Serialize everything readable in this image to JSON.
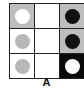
{
  "figure": {
    "label": "A",
    "rows": 3,
    "cols": 3,
    "colors": {
      "grey_bg": "#bdbdbd",
      "white_bg": "#ffffff",
      "black_bg": "#0a0a0a",
      "white_disc": "#ffffff",
      "grey_disc": "#b8b8b8",
      "black_disc": "#111111"
    },
    "cells": [
      {
        "row": 0,
        "col": 0,
        "bg": "#bdbdbd",
        "disc": "#ffffff"
      },
      {
        "row": 0,
        "col": 1,
        "bg": "#ffffff",
        "disc": null
      },
      {
        "row": 0,
        "col": 2,
        "bg": "#bdbdbd",
        "disc": "#111111"
      },
      {
        "row": 1,
        "col": 0,
        "bg": "#ffffff",
        "disc": "#b8b8b8"
      },
      {
        "row": 1,
        "col": 1,
        "bg": "#ffffff",
        "disc": null
      },
      {
        "row": 1,
        "col": 2,
        "bg": "#bdbdbd",
        "disc": "#111111"
      },
      {
        "row": 2,
        "col": 0,
        "bg": "#ffffff",
        "disc": "#b8b8b8"
      },
      {
        "row": 2,
        "col": 1,
        "bg": "#ffffff",
        "disc": null
      },
      {
        "row": 2,
        "col": 2,
        "bg": "#0a0a0a",
        "disc": "#ffffff"
      }
    ]
  }
}
